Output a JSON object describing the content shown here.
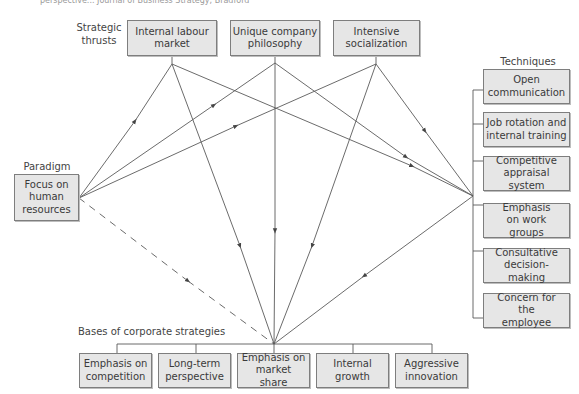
{
  "caption": "perspective...    Journal of Business Strategy, Bradford",
  "labels": {
    "strategic_thrusts": "Strategic\nthrusts",
    "techniques": "Techniques",
    "paradigm": "Paradigm",
    "bases": "Bases of corporate strategies"
  },
  "strategic_thrusts": [
    {
      "label": "Internal labour market"
    },
    {
      "label": "Unique company philosophy"
    },
    {
      "label": "Intensive socialization"
    }
  ],
  "paradigm": {
    "label": "Focus on human resources"
  },
  "techniques": [
    {
      "label": "Open communication"
    },
    {
      "label": "Job rotation and internal training"
    },
    {
      "label": "Competitive appraisal system"
    },
    {
      "label": "Emphasis on work groups"
    },
    {
      "label": "Consultative decision-making"
    },
    {
      "label": "Concern for the employee"
    }
  ],
  "bases": [
    {
      "label": "Emphasis on competition"
    },
    {
      "label": "Long-term perspective"
    },
    {
      "label": "Emphasis on market share"
    },
    {
      "label": "Internal growth"
    },
    {
      "label": "Aggressive innovation"
    }
  ],
  "colors": {
    "box_fill": "#e6e6e6",
    "box_border": "#7e7e7e",
    "line": "#555555"
  }
}
